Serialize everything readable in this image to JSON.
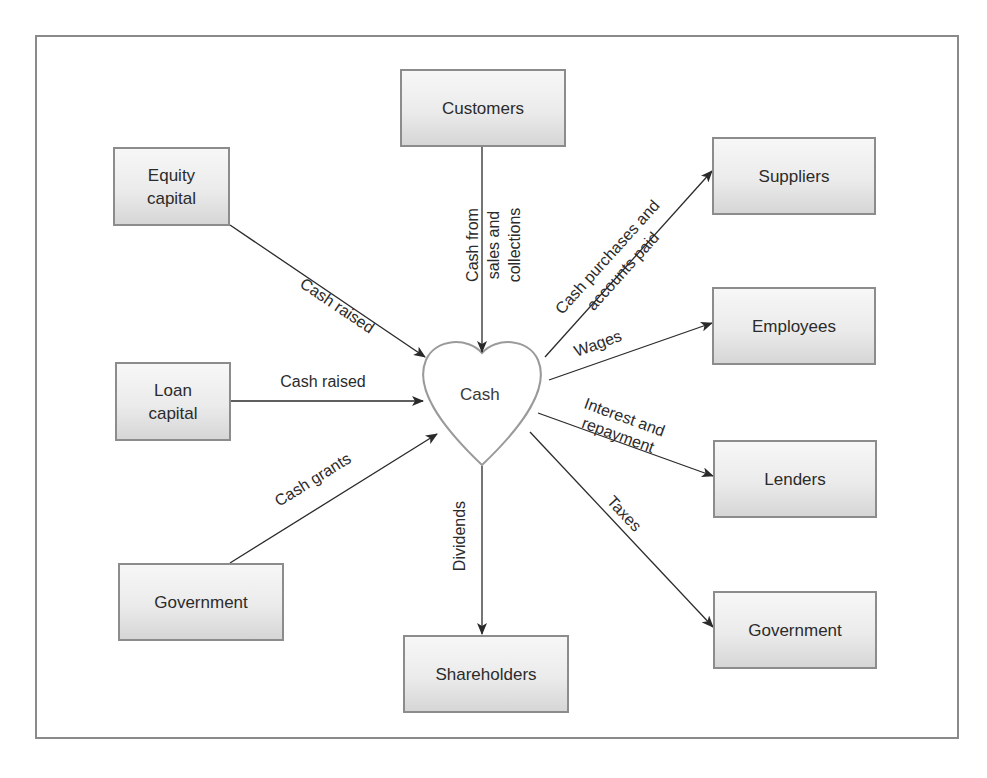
{
  "diagram": {
    "type": "cash-flow-diagram",
    "center": {
      "label": "Cash",
      "shape": "heart"
    },
    "nodes": {
      "customers": "Customers",
      "equity_capital": "Equity\ncapital",
      "loan_capital": "Loan\ncapital",
      "government_left": "Government",
      "shareholders": "Shareholders",
      "suppliers": "Suppliers",
      "employees": "Employees",
      "lenders": "Lenders",
      "government_right": "Government"
    },
    "edges": [
      {
        "from": "Customers",
        "to": "Cash",
        "label": "Cash from\nsales and\ncollections"
      },
      {
        "from": "Equity capital",
        "to": "Cash",
        "label": "Cash raised"
      },
      {
        "from": "Loan capital",
        "to": "Cash",
        "label": "Cash raised"
      },
      {
        "from": "Government",
        "to": "Cash",
        "label": "Cash grants"
      },
      {
        "from": "Cash",
        "to": "Shareholders",
        "label": "Dividends"
      },
      {
        "from": "Cash",
        "to": "Suppliers",
        "label": "Cash purchases and\naccounts paid"
      },
      {
        "from": "Cash",
        "to": "Employees",
        "label": "Wages"
      },
      {
        "from": "Cash",
        "to": "Lenders",
        "label": "Interest and\nrepayment"
      },
      {
        "from": "Cash",
        "to": "Government",
        "label": "Taxes"
      }
    ],
    "edge_labels": {
      "customers": "Cash from\nsales and\ncollections",
      "equity": "Cash raised",
      "loan": "Cash raised",
      "grants": "Cash grants",
      "dividends": "Dividends",
      "suppliers": "Cash purchases and\naccounts paid",
      "wages": "Wages",
      "lenders": "Interest and\nrepayment",
      "taxes": "Taxes"
    },
    "colors": {
      "box_border": "#8c8c8c",
      "box_fill_top": "#f7f7f7",
      "box_fill_bottom": "#d6d6d6",
      "heart_stroke": "#9a9a9a",
      "arrow": "#2a2a2a",
      "frame": "#8a8a8a"
    }
  }
}
